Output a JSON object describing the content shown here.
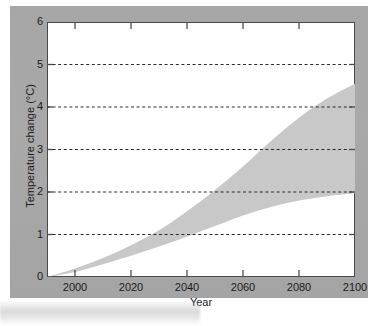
{
  "figure": {
    "background_color": "#a8a8a8",
    "plot_background_color": "#ffffff",
    "axis_color": "#4a4a4a",
    "band_color": "#c8c8c8",
    "grid_color": "#2b2b2b"
  },
  "chart_data": {
    "type": "area",
    "title": "",
    "subtitle": "",
    "xlabel": "Year",
    "ylabel": "Temperature change (°C)",
    "xlim": [
      1990,
      2100
    ],
    "ylim": [
      0,
      6
    ],
    "xticks": [
      2000,
      2020,
      2040,
      2060,
      2080,
      2100
    ],
    "xticklabels": [
      "2000",
      "2020",
      "2040",
      "2060",
      "2080",
      "2100"
    ],
    "yticks": [
      0,
      1,
      2,
      3,
      4,
      5,
      6
    ],
    "yticklabels": [
      "0",
      "1",
      "2",
      "3",
      "4",
      "5",
      "6"
    ],
    "grid": "horizontal-dashed",
    "gridlines_at": [
      1,
      2,
      3,
      4,
      5
    ],
    "legend": "none",
    "annotations": [],
    "x": [
      1990,
      2000,
      2010,
      2020,
      2030,
      2040,
      2050,
      2060,
      2070,
      2080,
      2090,
      2100
    ],
    "series": [
      {
        "name": "Upper bound (high emissions scenario)",
        "values": [
          0.0,
          0.2,
          0.45,
          0.75,
          1.1,
          1.55,
          2.05,
          2.6,
          3.2,
          3.75,
          4.2,
          4.55
        ]
      },
      {
        "name": "Lower bound (low emissions scenario)",
        "values": [
          0.0,
          0.12,
          0.3,
          0.5,
          0.72,
          0.95,
          1.2,
          1.45,
          1.65,
          1.8,
          1.9,
          1.97
        ]
      }
    ],
    "band": {
      "name": "Projected range of global mean temperature change",
      "fill_color": "#c8c8c8"
    }
  }
}
